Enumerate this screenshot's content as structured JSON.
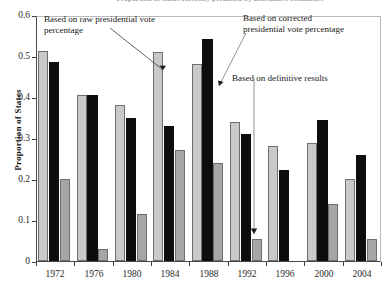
{
  "chart_data": {
    "type": "bar",
    "title": "Proportion of states correctly predicted by alternative estimators",
    "xlabel": "",
    "ylabel": "Proportion of States",
    "ylim": [
      0,
      0.6
    ],
    "yticks": [
      "0",
      "0.1",
      "0.2",
      "0.3",
      "0.4",
      "0.5",
      "0.6"
    ],
    "ytick_values": [
      0,
      0.1,
      0.2,
      0.3,
      0.4,
      0.5,
      0.6
    ],
    "grid": false,
    "legend_position": "annotations-with-arrows",
    "categories": [
      "1972",
      "1976",
      "1980",
      "1984",
      "1988",
      "1992",
      "1996",
      "2000",
      "2004"
    ],
    "series": [
      {
        "name": "Based on raw presidential vote percentage",
        "color": "#c9c9c9",
        "values": [
          0.513,
          0.405,
          0.381,
          0.511,
          0.481,
          0.339,
          0.28,
          0.287,
          0.2
        ]
      },
      {
        "name": "Based on corrected presidential vote percentage",
        "color": "#0d0d0d",
        "values": [
          0.486,
          0.405,
          0.35,
          0.33,
          0.542,
          0.31,
          0.223,
          0.345,
          0.258
        ]
      },
      {
        "name": "Based on definitive results",
        "color": "#a6a6a6",
        "values": [
          0.199,
          0.029,
          0.114,
          0.27,
          0.24,
          0.053,
          null,
          0.14,
          0.053
        ]
      }
    ],
    "annotations": [
      {
        "id": "annot-raw",
        "text": "Based on raw presidential vote percentage",
        "points_to": "1984 light-gray bar"
      },
      {
        "id": "annot-corr",
        "text": "Based on corrected presidential vote percentage",
        "points_to": "1988 black bar"
      },
      {
        "id": "annot-def",
        "text": "Based on definitive results",
        "points_to": "1992 medium-gray bar"
      }
    ]
  },
  "annotations": {
    "raw_line1": "Based on raw presidential vote",
    "raw_line2": "percentage",
    "corrected_line1": "Based on corrected",
    "corrected_line2": "presidential vote percentage",
    "definitive": "Based on definitive results"
  },
  "axes": {
    "y_title": "Proportion of States",
    "y_labels": [
      "0.6",
      "0.5",
      "0.4",
      "0.3",
      "0.2",
      "0.1",
      "0"
    ],
    "x_labels": [
      "1972",
      "1976",
      "1980",
      "1984",
      "1988",
      "1992",
      "1996",
      "2000",
      "2004"
    ]
  },
  "title": "Proportion of states correctly predicted by alternative estimators"
}
